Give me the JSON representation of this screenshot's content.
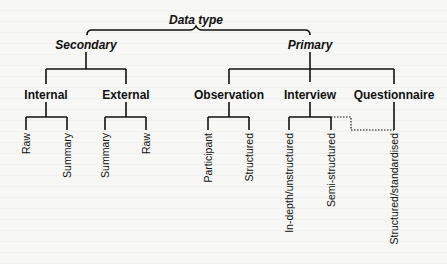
{
  "diagram": {
    "root": {
      "label": "Data type"
    },
    "branches": [
      {
        "label": "Secondary",
        "children": [
          {
            "label": "Internal",
            "leaves": [
              "Raw",
              "Summary"
            ]
          },
          {
            "label": "External",
            "leaves": [
              "Summary",
              "Raw"
            ]
          }
        ]
      },
      {
        "label": "Primary",
        "children": [
          {
            "label": "Observation",
            "leaves": [
              "Participant",
              "Structured"
            ]
          },
          {
            "label": "Interview",
            "leaves": [
              "In-depth/unstructured",
              "Semi-structured"
            ]
          },
          {
            "label": "Questionnaire",
            "leaves": [
              "Structured/standardised"
            ]
          }
        ]
      }
    ],
    "dotted_link": {
      "from": "Interview",
      "to": "Questionnaire"
    },
    "colors": {
      "line": "#111111",
      "background": "#f7f7f5",
      "text": "#111111"
    }
  }
}
